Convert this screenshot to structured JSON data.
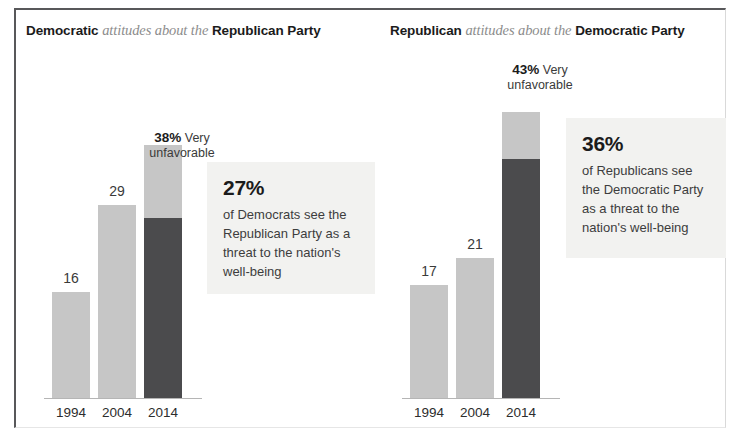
{
  "chart_data": {
    "type": "bar",
    "panels": [
      {
        "id": "democratic-views",
        "title_parts": {
          "lead_bold": "Democratic",
          "middle_italic": "attitudes about the",
          "trail_bold": "Republican Party"
        },
        "categories": [
          "1994",
          "2004",
          "2014"
        ],
        "values": [
          16,
          29,
          38
        ],
        "value_labels": [
          "16",
          "29",
          "38"
        ],
        "ylabel": "",
        "xlabel": "",
        "ylim": [
          0,
          50
        ],
        "grid": false,
        "legend": false,
        "series": [
          {
            "name": "Unfavorable (total)",
            "values": [
              16,
              29,
              38
            ],
            "color": "#c6c6c6"
          },
          {
            "name": "Very unfavorable",
            "values": [
              null,
              null,
              27
            ],
            "color": "#4b4b4d"
          }
        ],
        "top_annotation": {
          "pct": "38%",
          "text": " Very",
          "line2": "unfavorable"
        },
        "callout": {
          "pct": "27%",
          "line1": "of Democrats see the",
          "line2": "Republican Party as a",
          "line3": "threat to the nation's",
          "line4": "well-being"
        }
      },
      {
        "id": "republican-views",
        "title_parts": {
          "lead_bold": "Republican",
          "middle_italic": "attitudes about the",
          "trail_bold": "Democratic Party"
        },
        "categories": [
          "1994",
          "2004",
          "2014"
        ],
        "values": [
          17,
          21,
          43
        ],
        "value_labels": [
          "17",
          "21",
          "43"
        ],
        "ylabel": "",
        "xlabel": "",
        "ylim": [
          0,
          50
        ],
        "grid": false,
        "legend": false,
        "series": [
          {
            "name": "Unfavorable (total)",
            "values": [
              17,
              21,
              43
            ],
            "color": "#c6c6c6"
          },
          {
            "name": "Very unfavorable",
            "values": [
              null,
              null,
              36
            ],
            "color": "#4b4b4d"
          }
        ],
        "top_annotation": {
          "pct": "43%",
          "text": " Very",
          "line2": "unfavorable"
        },
        "callout": {
          "pct": "36%",
          "line1": "of Republicans see",
          "line2": "the Democratic Party",
          "line3": "as a threat to the",
          "line4": "nation's well-being"
        }
      }
    ],
    "colors": {
      "light_bar": "#c6c6c6",
      "dark_bar": "#4b4b4d",
      "callout_bg": "#f2f2f0",
      "text": "#231f20",
      "italic_text": "#8c8c8c"
    }
  }
}
